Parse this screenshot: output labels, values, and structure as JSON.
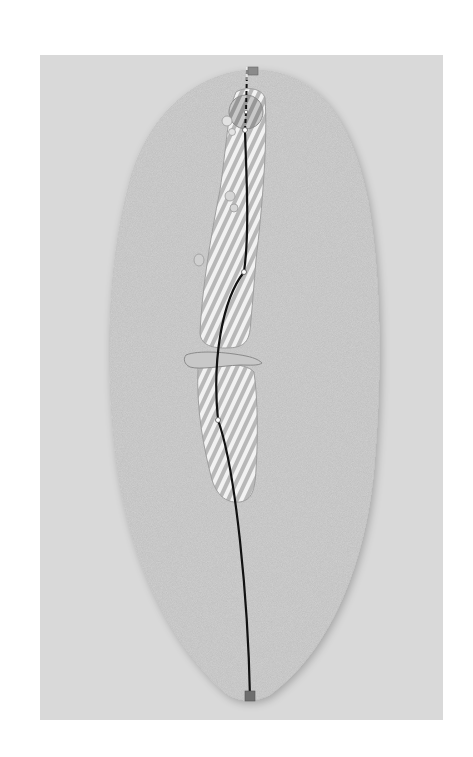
{
  "diagram": {
    "colors": {
      "page_background": "#ffffff",
      "panel_background": "#d9d9d9",
      "rough": "#bdbdbd",
      "fairway_stripe_light": "#f2f2f2",
      "fairway_stripe_dark": "#b5b5b5",
      "green_stripe_dark": "#9a9a9a",
      "shot_line": "#111111",
      "flag": "#8a8a8a",
      "tee_box": "#6e6e6e",
      "water": "#c8c8c8"
    },
    "elements": [
      {
        "name": "rough",
        "type": "oval"
      },
      {
        "name": "fairway-upper",
        "type": "striped-area"
      },
      {
        "name": "fairway-lower",
        "type": "striped-area"
      },
      {
        "name": "green",
        "type": "striped-circle"
      },
      {
        "name": "creek",
        "type": "water-hazard"
      },
      {
        "name": "bunkers",
        "count": 5
      },
      {
        "name": "flag",
        "type": "pin"
      },
      {
        "name": "tee-box",
        "type": "square"
      },
      {
        "name": "shot-path",
        "waypoints": 3
      }
    ]
  }
}
